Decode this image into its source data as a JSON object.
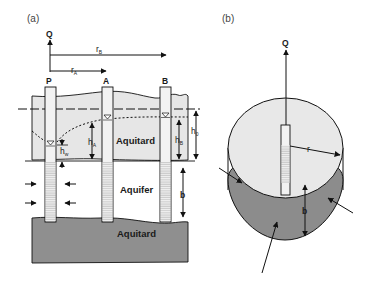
{
  "panel_a": {
    "label": "(a)",
    "discharge": "Q",
    "radius_b": "r",
    "radius_b_sub": "B",
    "radius_a": "r",
    "radius_a_sub": "A",
    "well_p": "P",
    "well_a": "A",
    "well_b": "B",
    "upper_layer": "Aquitard",
    "middle_layer": "Aquifer",
    "lower_layer": "Aquitard",
    "head_a": "h",
    "head_a_sub": "A",
    "head_b": "h",
    "head_b_sub": "B",
    "head_w": "h",
    "head_w_sub": "w",
    "head_0": "h",
    "head_0_sub": "0",
    "thickness": "b"
  },
  "panel_b": {
    "label": "(b)",
    "discharge": "Q",
    "radius": "r",
    "thickness": "b"
  },
  "colors": {
    "aquitard_upper": "#e6e6e6",
    "aquitard_lower": "#8f8f8f",
    "aquifer": "#ffffff",
    "cylinder_top": "#e8e8e8",
    "cylinder_bottom": "#8c8c8c",
    "line": "#111111"
  }
}
